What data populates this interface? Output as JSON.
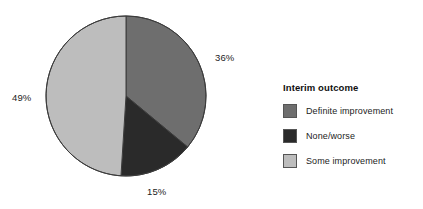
{
  "chart_data": {
    "type": "pie",
    "title": "",
    "legend_title": "Interim outcome",
    "legend_position": "right",
    "start_angle_deg": 0,
    "direction": "clockwise",
    "categories": [
      "Definite improvement",
      "None/worse",
      "Some improvement"
    ],
    "values": [
      36,
      15,
      49
    ],
    "value_unit": "%",
    "data_labels": [
      "36%",
      "15%",
      "49%"
    ],
    "colors": [
      "#6e6e6e",
      "#2a2a2a",
      "#bdbdbd"
    ],
    "slice_outline_color": "#3c3c3c",
    "background_color": "#ffffff"
  },
  "pie": {
    "labels": {
      "definite": "36%",
      "none_worse": "15%",
      "some": "49%"
    }
  },
  "legend": {
    "title": "Interim outcome",
    "items": [
      {
        "label": "Definite improvement",
        "color": "#6e6e6e"
      },
      {
        "label": "None/worse",
        "color": "#2a2a2a"
      },
      {
        "label": "Some improvement",
        "color": "#bdbdbd"
      }
    ]
  }
}
